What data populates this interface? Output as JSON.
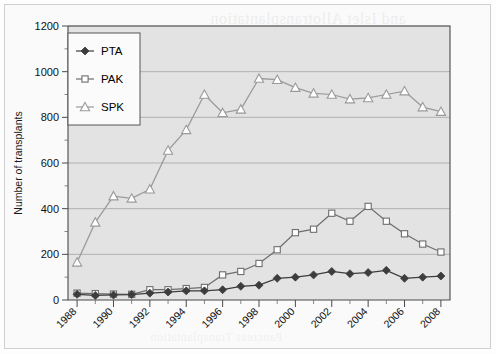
{
  "figure": {
    "background_color": "#fafafa",
    "plot_background_color": "#e3e3e3",
    "showthrough_note": "faint mirrored text bleeding through from reverse of scanned page"
  },
  "showthrough": {
    "line1": "and Islet Allotransplantation",
    "line2": "transplants performed each year in the",
    "line3": "recipients the number of pancreas",
    "line4": "transplanted alone has remained",
    "line5": "relatively constant over the period",
    "line6": "Pancreas Transplantation"
  },
  "legend": {
    "position": "top-left-inside",
    "items": [
      {
        "label": "PTA",
        "marker": "filled-diamond",
        "color": "#3d3d3d"
      },
      {
        "label": "PAK",
        "marker": "open-square",
        "color": "#6e6e6e"
      },
      {
        "label": "SPK",
        "marker": "open-triangle",
        "color": "#9a9a9a"
      }
    ]
  },
  "chart_data": {
    "type": "line",
    "title": "",
    "xlabel": "",
    "ylabel": "Number of transplants",
    "xlim": [
      1987.5,
      2008.5
    ],
    "ylim": [
      0,
      1200
    ],
    "grid": true,
    "y_ticks": [
      0,
      200,
      400,
      600,
      800,
      1000,
      1200
    ],
    "y_tick_labels": [
      "0",
      "200",
      "400",
      "600",
      "800",
      "1000",
      "1200"
    ],
    "y_minor_step": 100,
    "x": [
      1988,
      1989,
      1990,
      1991,
      1992,
      1993,
      1994,
      1995,
      1996,
      1997,
      1998,
      1999,
      2000,
      2001,
      2002,
      2003,
      2004,
      2005,
      2006,
      2007,
      2008
    ],
    "x_tick_labels": [
      "1988",
      "1990",
      "1992",
      "1994",
      "1996",
      "1998",
      "2000",
      "2002",
      "2004",
      "2006",
      "2008"
    ],
    "x_tick_values": [
      1988,
      1990,
      1992,
      1994,
      1996,
      1998,
      2000,
      2002,
      2004,
      2006,
      2008
    ],
    "x_label_rotation_deg": -45,
    "series": [
      {
        "name": "PTA",
        "marker": "filled-diamond",
        "color": "#3d3d3d",
        "values": [
          25,
          20,
          22,
          24,
          30,
          35,
          40,
          40,
          45,
          60,
          65,
          95,
          100,
          110,
          125,
          115,
          120,
          130,
          95,
          100,
          105
        ]
      },
      {
        "name": "PAK",
        "marker": "open-square",
        "color": "#6e6e6e",
        "values": [
          30,
          28,
          26,
          25,
          45,
          45,
          50,
          55,
          110,
          125,
          160,
          220,
          295,
          310,
          380,
          345,
          410,
          345,
          290,
          245,
          210
        ]
      },
      {
        "name": "SPK",
        "marker": "open-triangle",
        "color": "#9a9a9a",
        "values": [
          165,
          340,
          455,
          445,
          485,
          655,
          745,
          900,
          820,
          835,
          970,
          965,
          930,
          905,
          900,
          880,
          885,
          900,
          915,
          845,
          825
        ]
      }
    ]
  }
}
